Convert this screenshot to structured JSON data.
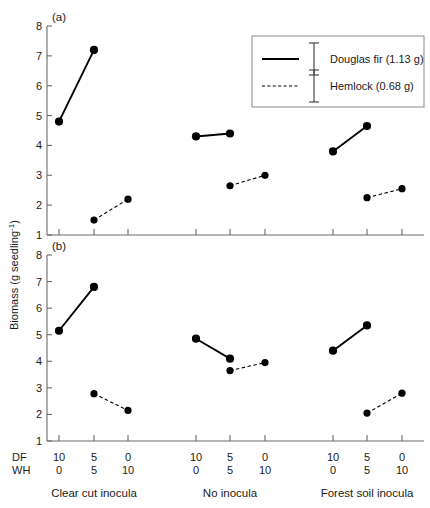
{
  "chart_data": {
    "type": "line",
    "title": "",
    "ylabel": "Biomass (g seedling",
    "ylabel_sup": "-1",
    "ylabel_tail": ")",
    "ylim": [
      1,
      8
    ],
    "yticks": [
      1,
      2,
      3,
      4,
      5,
      6,
      7,
      8
    ],
    "ytick_labels": [
      "1",
      "2",
      "3",
      "4",
      "5",
      "6",
      "7",
      "8"
    ],
    "grid": false,
    "legend_position": "top-right",
    "x_axis": {
      "row_labels": [
        "DF",
        "WH"
      ],
      "df_values": [
        "10",
        "5",
        "0",
        "10",
        "5",
        "0",
        "10",
        "5",
        "0"
      ],
      "wh_values": [
        "0",
        "5",
        "10",
        "0",
        "5",
        "10",
        "0",
        "5",
        "10"
      ],
      "group_labels": [
        "Clear cut inocula",
        "No inocula",
        "Forest soil inocula"
      ]
    },
    "legend": [
      {
        "name": "Douglas fir (1.13 g)",
        "style": "solid"
      },
      {
        "name": "Hemlock (0.68 g)",
        "style": "dashed"
      }
    ],
    "panels": [
      {
        "label": "(a)",
        "groups": [
          {
            "name": "Clear cut inocula",
            "series": [
              {
                "name": "Douglas fir (1.13 g)",
                "style": "solid",
                "points": [
                  {
                    "x": 0,
                    "y": 4.8
                  },
                  {
                    "x": 1,
                    "y": 7.2
                  }
                ]
              },
              {
                "name": "Hemlock (0.68 g)",
                "style": "dashed",
                "points": [
                  {
                    "x": 1,
                    "y": 1.5
                  },
                  {
                    "x": 2,
                    "y": 2.2
                  }
                ]
              }
            ]
          },
          {
            "name": "No inocula",
            "series": [
              {
                "name": "Douglas fir (1.13 g)",
                "style": "solid",
                "points": [
                  {
                    "x": 0,
                    "y": 4.3
                  },
                  {
                    "x": 1,
                    "y": 4.4
                  }
                ]
              },
              {
                "name": "Hemlock (0.68 g)",
                "style": "dashed",
                "points": [
                  {
                    "x": 1,
                    "y": 2.65
                  },
                  {
                    "x": 2,
                    "y": 3.0
                  }
                ]
              }
            ]
          },
          {
            "name": "Forest soil inocula",
            "series": [
              {
                "name": "Douglas fir (1.13 g)",
                "style": "solid",
                "points": [
                  {
                    "x": 0,
                    "y": 3.8
                  },
                  {
                    "x": 1,
                    "y": 4.65
                  }
                ]
              },
              {
                "name": "Hemlock (0.68 g)",
                "style": "dashed",
                "points": [
                  {
                    "x": 1,
                    "y": 2.25
                  },
                  {
                    "x": 2,
                    "y": 2.55
                  }
                ]
              }
            ]
          }
        ]
      },
      {
        "label": "(b)",
        "groups": [
          {
            "name": "Clear cut inocula",
            "series": [
              {
                "name": "Douglas fir (1.13 g)",
                "style": "solid",
                "points": [
                  {
                    "x": 0,
                    "y": 5.15
                  },
                  {
                    "x": 1,
                    "y": 6.8
                  }
                ]
              },
              {
                "name": "Hemlock (0.68 g)",
                "style": "dashed",
                "points": [
                  {
                    "x": 1,
                    "y": 2.78
                  },
                  {
                    "x": 2,
                    "y": 2.15
                  }
                ]
              }
            ]
          },
          {
            "name": "No inocula",
            "series": [
              {
                "name": "Douglas fir (1.13 g)",
                "style": "solid",
                "points": [
                  {
                    "x": 0,
                    "y": 4.85
                  },
                  {
                    "x": 1,
                    "y": 4.1
                  }
                ]
              },
              {
                "name": "Hemlock (0.68 g)",
                "style": "dashed",
                "points": [
                  {
                    "x": 1,
                    "y": 3.65
                  },
                  {
                    "x": 2,
                    "y": 3.95
                  }
                ]
              }
            ]
          },
          {
            "name": "Forest soil inocula",
            "series": [
              {
                "name": "Douglas fir (1.13 g)",
                "style": "solid",
                "points": [
                  {
                    "x": 0,
                    "y": 4.4
                  },
                  {
                    "x": 1,
                    "y": 5.35
                  }
                ]
              },
              {
                "name": "Hemlock (0.68 g)",
                "style": "dashed",
                "points": [
                  {
                    "x": 1,
                    "y": 2.05
                  },
                  {
                    "x": 2,
                    "y": 2.8
                  }
                ]
              }
            ]
          }
        ]
      }
    ]
  }
}
